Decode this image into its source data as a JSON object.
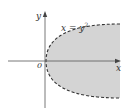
{
  "figure": {
    "type": "region-plot",
    "equation_label": {
      "lhs": "x",
      "eq": " = ",
      "base": "y",
      "exponent": "2"
    },
    "axis_labels": {
      "y": "y",
      "x": "x",
      "origin": "0"
    },
    "region": {
      "description": "region to the right of parabola x = y^2 (shaded), boundary dashed",
      "fill_color": "#d4d4d4",
      "boundary_color": "#333333",
      "boundary_style": "dashed"
    },
    "colors": {
      "axis": "#555555",
      "background": "#ffffff"
    }
  }
}
